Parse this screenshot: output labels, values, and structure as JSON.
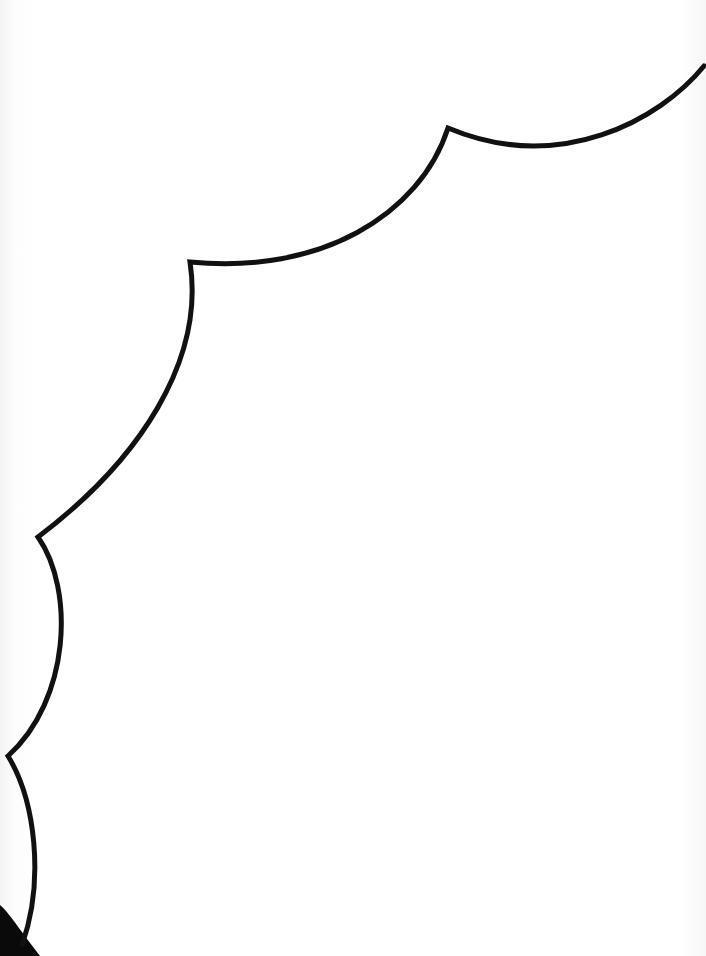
{
  "canvas": {
    "width": 706,
    "height": 956,
    "background": "#ffffff"
  },
  "outline": {
    "description": "scalloped cloud / speech-bubble edge",
    "stroke_color": "#111111",
    "stroke_width": 5,
    "vertices": [
      [
        700,
        68
      ],
      [
        448,
        128
      ],
      [
        190,
        262
      ],
      [
        38,
        537
      ],
      [
        8,
        756
      ],
      [
        22,
        945
      ]
    ]
  },
  "corner_shadow": {
    "color": "#0a0a0a",
    "position": "bottom-left"
  }
}
